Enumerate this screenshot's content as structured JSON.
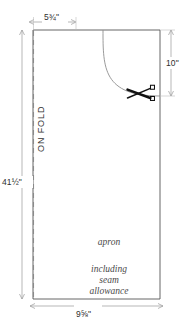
{
  "diagram": {
    "piece_name": "apron",
    "seam_note_line1": "including",
    "seam_note_line2": "seam",
    "seam_note_line3": "allowance",
    "fold_label": "ON FOLD",
    "colors": {
      "outline": "#555555",
      "dimension_line": "#999999",
      "text": "#2e2e2e",
      "piece_text": "#4a4a4a",
      "background": "#ffffff",
      "scissors": "#111111"
    },
    "dimensions": {
      "top_width": "5¾\"",
      "bottom_width": "9⅝\"",
      "left_height": "41½\"",
      "right_height": "10\""
    },
    "icons": {
      "scissors": "scissors-cut-icon"
    }
  }
}
